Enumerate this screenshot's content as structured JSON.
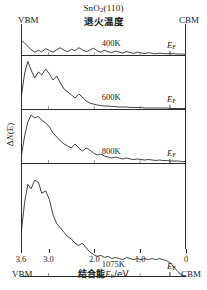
{
  "figure": {
    "title_compound": "SnO2(110)",
    "title_compound_base": "SnO",
    "title_compound_sub": "2",
    "title_compound_tail": "(110)",
    "title_anneal": "退火温度",
    "label_vbm_top": "VBM",
    "label_cbm_top": "CBM",
    "label_vbm_bottom": "VBM",
    "label_cbm_bottom": "CBM",
    "ylabel_prefix": "Δ",
    "ylabel_n": "N",
    "ylabel_suffix": "(E)",
    "xlabel_cn": "结合能",
    "xlabel_sym": "E",
    "xlabel_sub": "b",
    "xlabel_unit": "/eV",
    "ef_label": "E",
    "ef_sub": "F"
  },
  "chart_data": {
    "type": "line",
    "title": "SnO2(110) 退火温度",
    "xlabel": "结合能 Eb/eV",
    "ylabel": "ΔN(E)",
    "xlim": [
      3.6,
      0
    ],
    "x_axis_inverted": true,
    "xticks": [
      3.6,
      3.0,
      2.0,
      1.0,
      0
    ],
    "xticklabels": [
      "3.6",
      "3.0",
      "2.0",
      "1.0",
      "0"
    ],
    "grid": false,
    "legend": "none",
    "annotations": [
      {
        "text": "VBM",
        "position": "left-edge",
        "binding_energy": 3.6
      },
      {
        "text": "CBM",
        "position": "right-edge",
        "binding_energy": 0.0
      },
      {
        "text": "EF",
        "position": "near-right",
        "binding_energy": 0.35
      }
    ],
    "series": [
      {
        "name": "400K",
        "panel": 1,
        "fermi_level_eV": 0.35,
        "x": [
          3.6,
          3.52,
          3.45,
          3.38,
          3.3,
          3.22,
          3.15,
          3.06,
          2.98,
          2.9,
          2.82,
          2.74,
          2.66,
          2.58,
          2.5,
          2.42,
          2.34,
          2.26,
          2.18,
          2.1,
          2.02,
          1.94,
          1.86,
          1.78,
          1.7,
          1.62,
          1.54,
          1.46,
          1.38,
          1.3,
          1.22,
          1.14,
          1.06,
          0.98,
          0.9,
          0.82,
          0.74,
          0.66,
          0.58,
          0.5,
          0.42,
          0.34,
          0.26,
          0.18,
          0.1,
          0.0
        ],
        "y": [
          0.62,
          0.5,
          0.36,
          0.22,
          0.12,
          0.2,
          0.13,
          0.26,
          0.18,
          0.12,
          0.22,
          0.3,
          0.2,
          0.14,
          0.24,
          0.18,
          0.3,
          0.22,
          0.14,
          0.2,
          0.28,
          0.18,
          0.12,
          0.2,
          0.14,
          0.1,
          0.16,
          0.12,
          0.08,
          0.14,
          0.1,
          0.07,
          0.12,
          0.09,
          0.06,
          0.1,
          0.07,
          0.05,
          0.08,
          0.06,
          0.05,
          0.06,
          0.05,
          0.04,
          0.04,
          0.03
        ]
      },
      {
        "name": "600K",
        "panel": 2,
        "fermi_level_eV": 0.35,
        "x": [
          3.6,
          3.52,
          3.45,
          3.38,
          3.3,
          3.22,
          3.15,
          3.06,
          2.98,
          2.9,
          2.82,
          2.74,
          2.66,
          2.58,
          2.5,
          2.42,
          2.34,
          2.26,
          2.18,
          2.1,
          2.02,
          1.94,
          1.86,
          1.78,
          1.7,
          1.62,
          1.54,
          1.46,
          1.38,
          1.3,
          1.22,
          1.14,
          1.06,
          0.98,
          0.9,
          0.82,
          0.74,
          0.66,
          0.58,
          0.5,
          0.42,
          0.34,
          0.26,
          0.18,
          0.1,
          0.0
        ],
        "y": [
          0.2,
          0.72,
          0.95,
          0.78,
          0.62,
          0.74,
          0.68,
          0.8,
          0.7,
          0.58,
          0.66,
          0.52,
          0.4,
          0.34,
          0.28,
          0.22,
          0.3,
          0.24,
          0.16,
          0.12,
          0.1,
          0.08,
          0.07,
          0.06,
          0.06,
          0.05,
          0.05,
          0.04,
          0.04,
          0.04,
          0.03,
          0.03,
          0.03,
          0.03,
          0.02,
          0.02,
          0.02,
          0.02,
          0.02,
          0.02,
          0.02,
          0.01,
          0.01,
          0.01,
          0.01,
          0.01
        ]
      },
      {
        "name": "800K",
        "panel": 3,
        "fermi_level_eV": 0.35,
        "x": [
          3.6,
          3.52,
          3.45,
          3.38,
          3.3,
          3.22,
          3.15,
          3.06,
          2.98,
          2.9,
          2.82,
          2.74,
          2.66,
          2.58,
          2.5,
          2.42,
          2.34,
          2.26,
          2.18,
          2.1,
          2.02,
          1.94,
          1.86,
          1.78,
          1.7,
          1.62,
          1.54,
          1.46,
          1.38,
          1.3,
          1.22,
          1.14,
          1.06,
          0.98,
          0.9,
          0.82,
          0.74,
          0.66,
          0.58,
          0.5,
          0.42,
          0.34,
          0.26,
          0.18,
          0.1,
          0.0
        ],
        "y": [
          0.1,
          0.55,
          0.82,
          0.96,
          0.9,
          0.93,
          0.86,
          0.8,
          0.72,
          0.6,
          0.52,
          0.44,
          0.38,
          0.34,
          0.3,
          0.38,
          0.3,
          0.24,
          0.3,
          0.26,
          0.2,
          0.16,
          0.18,
          0.14,
          0.12,
          0.1,
          0.12,
          0.1,
          0.08,
          0.1,
          0.08,
          0.07,
          0.08,
          0.07,
          0.06,
          0.07,
          0.06,
          0.05,
          0.06,
          0.05,
          0.05,
          0.04,
          0.04,
          0.04,
          0.03,
          0.03
        ]
      },
      {
        "name": "1075K",
        "panel": 4,
        "fermi_level_eV": 0.35,
        "x": [
          3.6,
          3.52,
          3.45,
          3.38,
          3.3,
          3.22,
          3.15,
          3.06,
          2.98,
          2.9,
          2.82,
          2.74,
          2.66,
          2.58,
          2.5,
          2.42,
          2.34,
          2.26,
          2.18,
          2.1,
          2.02,
          1.94,
          1.86,
          1.78,
          1.7,
          1.62,
          1.54,
          1.46,
          1.38,
          1.3,
          1.22,
          1.14,
          1.06,
          0.98,
          0.9,
          0.82,
          0.74,
          0.66,
          0.58,
          0.5,
          0.42,
          0.34,
          0.26,
          0.18,
          0.1,
          0.0
        ],
        "y": [
          0.38,
          0.68,
          0.84,
          0.8,
          0.88,
          0.86,
          0.76,
          0.78,
          0.7,
          0.56,
          0.48,
          0.44,
          0.4,
          0.36,
          0.34,
          0.3,
          0.28,
          0.3,
          0.26,
          0.22,
          0.2,
          0.18,
          0.19,
          0.17,
          0.18,
          0.16,
          0.17,
          0.16,
          0.15,
          0.17,
          0.16,
          0.15,
          0.16,
          0.15,
          0.16,
          0.15,
          0.16,
          0.15,
          0.16,
          0.15,
          0.14,
          0.12,
          0.08,
          0.04,
          0.01,
          0.0
        ]
      }
    ]
  }
}
